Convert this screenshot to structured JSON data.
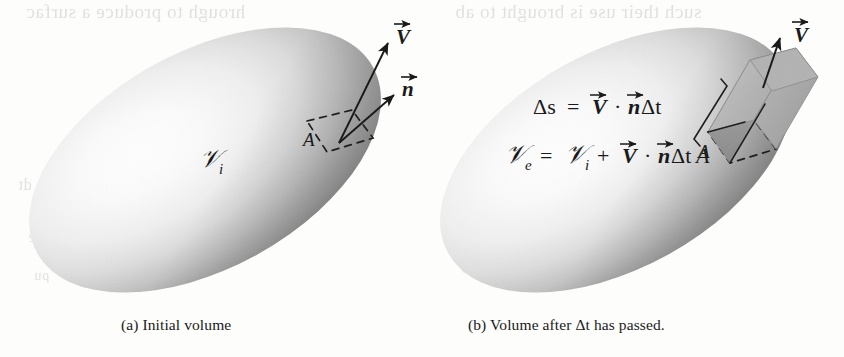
{
  "figure": {
    "kind": "two-panel-diagram",
    "background_color": "#fdfdfc"
  },
  "panels": [
    {
      "id": "a",
      "caption": "(a) Initial volume",
      "volume_label": "𝒱",
      "volume_subscript": "i",
      "labels": {
        "velocity_vector": "V",
        "normal_vector": "n",
        "area_patch": "A"
      }
    },
    {
      "id": "b",
      "caption": "(b) Volume after Δt has passed.",
      "labels": {
        "velocity_vector": "V",
        "area_patch": "A"
      },
      "equations": [
        {
          "id": "displacement",
          "parts": [
            "Δs",
            "=",
            "V",
            "·",
            "n",
            "Δt"
          ]
        },
        {
          "id": "final-volume",
          "parts": [
            "𝒱",
            "e",
            "=",
            "𝒱",
            "i",
            "+",
            "V",
            "·",
            "n",
            "Δt",
            "A"
          ]
        }
      ]
    }
  ],
  "colors": {
    "ink": "#1a1a1a",
    "paper": "#fdfdfc",
    "body_highlight": "#fbfbfb",
    "body_mid": "#d8d8d8",
    "body_edge": "#8a8a8a",
    "body_shadow": "#7c7c7c",
    "prism_light": "#b9b9b9",
    "prism_mid": "#a2a2a2",
    "prism_dark": "#8d8d8d",
    "bleed_text": "#b9b6b1"
  },
  "bleed_text": {
    "top_left": "hrough to produce a surfac",
    "top_right": "such their use is brought to ab",
    "mid_left": "dt",
    "low_left": "volume the",
    "low_left2": "ρu",
    "mid_right": "+ ∫∫",
    "low_right": "(ρu)"
  }
}
